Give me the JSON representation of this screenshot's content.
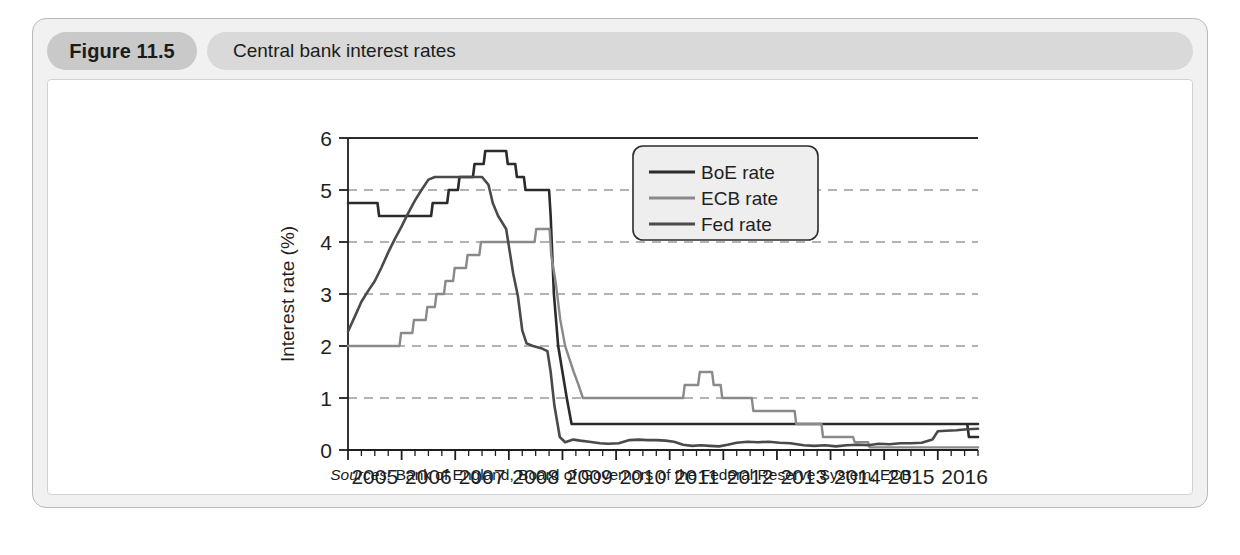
{
  "figure": {
    "number": "Figure 11.5",
    "title": "Central bank interest rates",
    "source_label": "Sources:",
    "source_text": "Bank of England, Board of Governors of the Federal Reserve System, ECB"
  },
  "colors": {
    "boe": "#2b2b2b",
    "ecb": "#8a8a8a",
    "fed": "#4a4a4a",
    "grid": "#9a9a9a",
    "axis": "#1f1f1f",
    "card_bg": "#f1f1f1",
    "plot_bg": "#ffffff",
    "pill_number_bg": "#c9c9c9",
    "pill_title_bg": "#d9d9d9"
  },
  "chart_data": {
    "type": "line",
    "title": "Central bank interest rates",
    "xlabel": "",
    "ylabel": "Interest rate (%)",
    "xlim": [
      2005.0,
      2016.75
    ],
    "ylim": [
      0,
      6
    ],
    "yticks": [
      0,
      1,
      2,
      3,
      4,
      5,
      6
    ],
    "ytick_labels": [
      "0",
      "1",
      "2",
      "3",
      "4",
      "5",
      "6"
    ],
    "xticks": [
      2005,
      2006,
      2007,
      2008,
      2009,
      2010,
      2011,
      2012,
      2013,
      2014,
      2015,
      2016
    ],
    "xtick_labels": [
      "2005",
      "2006",
      "2007",
      "2008",
      "2009",
      "2010",
      "2011",
      "2012",
      "2013",
      "2014",
      "2015",
      "2016"
    ],
    "minor_xtick_interval": 0.25,
    "grid": "horizontal-dashed",
    "legend_position": "top-center-right",
    "series": [
      {
        "name": "BoE rate",
        "color": "#2b2b2b",
        "points": [
          [
            2005.0,
            4.75
          ],
          [
            2005.55,
            4.75
          ],
          [
            2005.58,
            4.5
          ],
          [
            2006.55,
            4.5
          ],
          [
            2006.58,
            4.75
          ],
          [
            2006.85,
            4.75
          ],
          [
            2006.88,
            5.0
          ],
          [
            2007.05,
            5.0
          ],
          [
            2007.08,
            5.25
          ],
          [
            2007.33,
            5.25
          ],
          [
            2007.36,
            5.5
          ],
          [
            2007.53,
            5.5
          ],
          [
            2007.56,
            5.75
          ],
          [
            2007.95,
            5.75
          ],
          [
            2007.98,
            5.5
          ],
          [
            2008.12,
            5.5
          ],
          [
            2008.15,
            5.25
          ],
          [
            2008.28,
            5.25
          ],
          [
            2008.31,
            5.0
          ],
          [
            2008.75,
            5.0
          ],
          [
            2008.78,
            4.5
          ],
          [
            2008.84,
            3.0
          ],
          [
            2008.92,
            2.0
          ],
          [
            2009.0,
            1.5
          ],
          [
            2009.08,
            1.0
          ],
          [
            2009.17,
            0.5
          ],
          [
            2016.75,
            0.5
          ],
          [
            2016.55,
            0.5
          ],
          [
            2016.58,
            0.25
          ],
          [
            2016.75,
            0.25
          ]
        ]
      },
      {
        "name": "ECB rate",
        "color": "#8a8a8a",
        "points": [
          [
            2005.0,
            2.0
          ],
          [
            2005.96,
            2.0
          ],
          [
            2005.99,
            2.25
          ],
          [
            2006.2,
            2.25
          ],
          [
            2006.23,
            2.5
          ],
          [
            2006.45,
            2.5
          ],
          [
            2006.48,
            2.75
          ],
          [
            2006.62,
            2.75
          ],
          [
            2006.65,
            3.0
          ],
          [
            2006.79,
            3.0
          ],
          [
            2006.82,
            3.25
          ],
          [
            2006.96,
            3.25
          ],
          [
            2006.99,
            3.5
          ],
          [
            2007.2,
            3.5
          ],
          [
            2007.23,
            3.75
          ],
          [
            2007.45,
            3.75
          ],
          [
            2007.48,
            4.0
          ],
          [
            2008.48,
            4.0
          ],
          [
            2008.51,
            4.25
          ],
          [
            2008.76,
            4.25
          ],
          [
            2008.79,
            3.75
          ],
          [
            2008.87,
            3.25
          ],
          [
            2008.96,
            2.5
          ],
          [
            2009.05,
            2.0
          ],
          [
            2009.21,
            1.5
          ],
          [
            2009.3,
            1.25
          ],
          [
            2009.38,
            1.0
          ],
          [
            2011.25,
            1.0
          ],
          [
            2011.28,
            1.25
          ],
          [
            2011.53,
            1.25
          ],
          [
            2011.56,
            1.5
          ],
          [
            2011.79,
            1.5
          ],
          [
            2011.82,
            1.25
          ],
          [
            2011.95,
            1.25
          ],
          [
            2011.98,
            1.0
          ],
          [
            2012.53,
            1.0
          ],
          [
            2012.56,
            0.75
          ],
          [
            2013.33,
            0.75
          ],
          [
            2013.36,
            0.5
          ],
          [
            2013.83,
            0.5
          ],
          [
            2013.86,
            0.25
          ],
          [
            2014.42,
            0.25
          ],
          [
            2014.45,
            0.15
          ],
          [
            2014.7,
            0.15
          ],
          [
            2014.73,
            0.05
          ],
          [
            2016.75,
            0.05
          ]
        ]
      },
      {
        "name": "Fed rate",
        "color": "#4a4a4a",
        "points": [
          [
            2005.0,
            2.28
          ],
          [
            2005.12,
            2.55
          ],
          [
            2005.25,
            2.85
          ],
          [
            2005.37,
            3.05
          ],
          [
            2005.5,
            3.25
          ],
          [
            2005.62,
            3.5
          ],
          [
            2005.75,
            3.8
          ],
          [
            2005.87,
            4.05
          ],
          [
            2006.0,
            4.3
          ],
          [
            2006.12,
            4.55
          ],
          [
            2006.25,
            4.8
          ],
          [
            2006.37,
            5.0
          ],
          [
            2006.5,
            5.2
          ],
          [
            2006.62,
            5.25
          ],
          [
            2007.5,
            5.25
          ],
          [
            2007.62,
            5.1
          ],
          [
            2007.7,
            4.75
          ],
          [
            2007.8,
            4.5
          ],
          [
            2007.95,
            4.25
          ],
          [
            2008.08,
            3.4
          ],
          [
            2008.17,
            2.95
          ],
          [
            2008.25,
            2.3
          ],
          [
            2008.33,
            2.05
          ],
          [
            2008.45,
            2.0
          ],
          [
            2008.62,
            1.95
          ],
          [
            2008.72,
            1.9
          ],
          [
            2008.78,
            1.5
          ],
          [
            2008.85,
            0.85
          ],
          [
            2008.95,
            0.25
          ],
          [
            2009.05,
            0.15
          ],
          [
            2009.2,
            0.2
          ],
          [
            2009.33,
            0.18
          ],
          [
            2009.5,
            0.16
          ],
          [
            2009.7,
            0.13
          ],
          [
            2009.85,
            0.12
          ],
          [
            2010.05,
            0.13
          ],
          [
            2010.25,
            0.19
          ],
          [
            2010.42,
            0.2
          ],
          [
            2010.58,
            0.19
          ],
          [
            2010.75,
            0.19
          ],
          [
            2010.92,
            0.18
          ],
          [
            2011.08,
            0.16
          ],
          [
            2011.25,
            0.1
          ],
          [
            2011.42,
            0.08
          ],
          [
            2011.58,
            0.09
          ],
          [
            2011.75,
            0.08
          ],
          [
            2011.92,
            0.07
          ],
          [
            2012.08,
            0.1
          ],
          [
            2012.25,
            0.14
          ],
          [
            2012.45,
            0.16
          ],
          [
            2012.65,
            0.15
          ],
          [
            2012.85,
            0.16
          ],
          [
            2013.05,
            0.14
          ],
          [
            2013.25,
            0.13
          ],
          [
            2013.5,
            0.09
          ],
          [
            2013.7,
            0.08
          ],
          [
            2013.9,
            0.09
          ],
          [
            2014.1,
            0.07
          ],
          [
            2014.3,
            0.09
          ],
          [
            2014.5,
            0.1
          ],
          [
            2014.7,
            0.09
          ],
          [
            2014.9,
            0.12
          ],
          [
            2015.1,
            0.11
          ],
          [
            2015.3,
            0.13
          ],
          [
            2015.5,
            0.13
          ],
          [
            2015.7,
            0.14
          ],
          [
            2015.9,
            0.2
          ],
          [
            2016.0,
            0.36
          ],
          [
            2016.15,
            0.37
          ],
          [
            2016.35,
            0.38
          ],
          [
            2016.55,
            0.4
          ],
          [
            2016.75,
            0.41
          ]
        ]
      }
    ],
    "legend": [
      {
        "label": "BoE rate",
        "color": "#2b2b2b"
      },
      {
        "label": "ECB rate",
        "color": "#8a8a8a"
      },
      {
        "label": "Fed rate",
        "color": "#4a4a4a"
      }
    ]
  }
}
